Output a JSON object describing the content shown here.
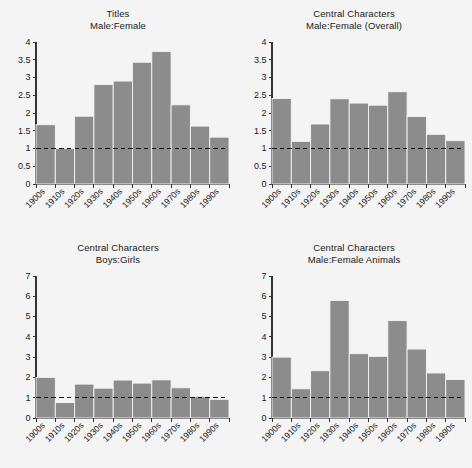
{
  "figure": {
    "background_color": "#f4f4f4",
    "bar_color": "#8c8c8c",
    "axis_color": "#333333",
    "reference_line_value": 1,
    "panel_count": 4
  },
  "chart_data": [
    {
      "type": "bar",
      "panel_index": 0,
      "title": "Titles\nMale:Female",
      "title_line1": "Titles",
      "title_line2": "Male:Female",
      "xlabel": "",
      "ylabel": "",
      "categories": [
        "1900s",
        "1910s",
        "1920s",
        "1930s",
        "1940s",
        "1950s",
        "1960s",
        "1970s",
        "1980s",
        "1990s"
      ],
      "values": [
        1.67,
        1.0,
        1.91,
        2.8,
        2.9,
        3.43,
        3.73,
        2.23,
        1.63,
        1.32
      ],
      "ylim": [
        0,
        4
      ],
      "yticks": [
        0,
        0.5,
        1,
        1.5,
        2,
        2.5,
        3,
        3.5,
        4
      ],
      "ytick_labels": [
        "0",
        "0.5",
        "1",
        "1.5",
        "2",
        "2.5",
        "3",
        "3.5",
        "4"
      ],
      "grid": false,
      "legend": "none",
      "reference_line": 1
    },
    {
      "type": "bar",
      "panel_index": 1,
      "title": "Central Characters\nMale:Female (Overall)",
      "title_line1": "Central Characters",
      "title_line2": "Male:Female (Overall)",
      "xlabel": "",
      "ylabel": "",
      "categories": [
        "1900s",
        "1910s",
        "1920s",
        "1930s",
        "1940s",
        "1950s",
        "1960s",
        "1970s",
        "1980s",
        "1990s"
      ],
      "values": [
        2.41,
        1.2,
        1.69,
        2.4,
        2.28,
        2.22,
        2.6,
        1.9,
        1.4,
        1.22
      ],
      "ylim": [
        0,
        4
      ],
      "yticks": [
        0,
        0.5,
        1,
        1.5,
        2,
        2.5,
        3,
        3.5,
        4
      ],
      "ytick_labels": [
        "0",
        "0.5",
        "1",
        "1.5",
        "2",
        "2.5",
        "3",
        "3.5",
        "4"
      ],
      "grid": false,
      "legend": "none",
      "reference_line": 1
    },
    {
      "type": "bar",
      "panel_index": 2,
      "title": "Central Characters\nBoys:Girls",
      "title_line1": "Central Characters",
      "title_line2": "Boys:Girls",
      "xlabel": "",
      "ylabel": "",
      "categories": [
        "1900s",
        "1910s",
        "1920s",
        "1930s",
        "1940s",
        "1950s",
        "1960s",
        "1970s",
        "1980s",
        "1990s"
      ],
      "values": [
        2.0,
        0.76,
        1.67,
        1.47,
        1.87,
        1.72,
        1.88,
        1.49,
        1.05,
        0.92
      ],
      "ylim": [
        0,
        7
      ],
      "yticks": [
        0,
        1,
        2,
        3,
        4,
        5,
        6,
        7
      ],
      "ytick_labels": [
        "0",
        "1",
        "2",
        "3",
        "4",
        "5",
        "6",
        "7"
      ],
      "grid": false,
      "legend": "none",
      "reference_line": 1
    },
    {
      "type": "bar",
      "panel_index": 3,
      "title": "Central Characters\nMale:Female Animals",
      "title_line1": "Central Characters",
      "title_line2": "Male:Female Animals",
      "xlabel": "",
      "ylabel": "",
      "categories": [
        "1900s",
        "1910s",
        "1920s",
        "1930s",
        "1940s",
        "1950s",
        "1960s",
        "1970s",
        "1980s",
        "1990s"
      ],
      "values": [
        3.0,
        1.44,
        2.33,
        5.79,
        3.17,
        3.04,
        4.8,
        3.4,
        2.22,
        1.9
      ],
      "ylim": [
        0,
        7
      ],
      "yticks": [
        0,
        1,
        2,
        3,
        4,
        5,
        6,
        7
      ],
      "ytick_labels": [
        "0",
        "1",
        "2",
        "3",
        "4",
        "5",
        "6",
        "7"
      ],
      "grid": false,
      "legend": "none",
      "reference_line": 1
    }
  ]
}
